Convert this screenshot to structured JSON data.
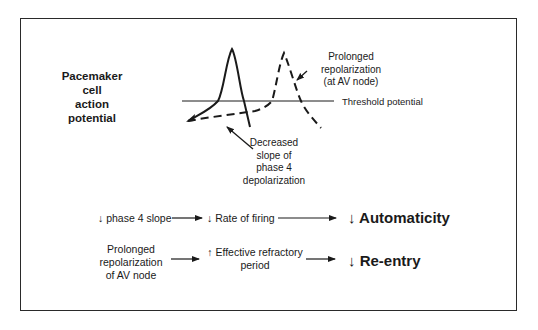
{
  "figure": {
    "title_lines": [
      "Pacemaker",
      "cell",
      "action",
      "potential"
    ],
    "threshold_label": "Threshold potential",
    "annotation_prolonged": [
      "Prolonged",
      "repolarization",
      "(at AV node)"
    ],
    "annotation_decreased": [
      "Decreased",
      "slope of",
      "phase 4",
      "depolarization"
    ]
  },
  "flow": {
    "row1": {
      "item1": "↓ phase 4 slope",
      "item2": "↓ Rate of firing",
      "result": "↓ Automaticity"
    },
    "row2": {
      "item1_lines": [
        "Prolonged",
        "repolarization",
        "of AV node"
      ],
      "item2_lines": [
        "↑ Effective refractory",
        "period"
      ],
      "result": "↓ Re-entry"
    }
  }
}
